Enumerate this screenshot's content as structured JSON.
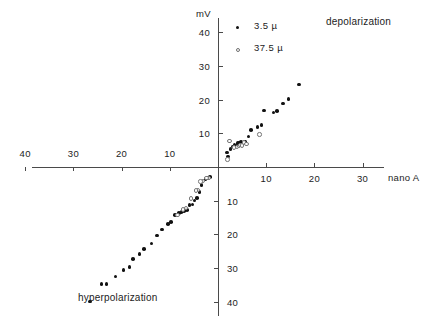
{
  "figure": {
    "width": 425,
    "height": 324,
    "background": "#ffffff",
    "axis_color": "#4a4a4a",
    "point_color": "#111111",
    "open_point_edge_color": "#777777"
  },
  "annotations": {
    "depolarization": "depolarization",
    "hyperpolarization": "hyperpolarization"
  },
  "legend": {
    "position": "top-center",
    "entries": [
      {
        "label": "3.5 µ",
        "marker": "filled-circle",
        "series": "3.5 µ"
      },
      {
        "label": "37.5 µ",
        "marker": "open-circle",
        "series": "37.5 µ"
      }
    ]
  },
  "axis_titles": {
    "y": "mV",
    "x": "nano A"
  },
  "chart_data": {
    "type": "scatter",
    "title": "",
    "subtitle": "",
    "xlabel": "nano A",
    "ylabel": "mV",
    "grid": false,
    "legend_position": "top-center",
    "quadrant_labels": {
      "upper_right": "depolarization",
      "lower_left": "hyperpolarization"
    },
    "axis_style": "four-quadrant cross through origin, magnitudes only (no minus signs)",
    "xlim": [
      -40,
      34
    ],
    "ylim": [
      -46,
      44
    ],
    "xticks_left_arm": [
      40,
      30,
      20,
      10
    ],
    "xticks_right_arm": [
      10,
      20,
      30
    ],
    "yticks_upper_arm": [
      10,
      20,
      30,
      40
    ],
    "yticks_lower_arm": [
      10,
      20,
      30,
      40
    ],
    "xtick_labels_left": [
      "40",
      "30",
      "20",
      "10"
    ],
    "xtick_labels_right": [
      "10",
      "20",
      "30"
    ],
    "ytick_labels_upper": [
      "10",
      "20",
      "30",
      "40"
    ],
    "ytick_labels_lower": [
      "10",
      "20",
      "30",
      "40"
    ],
    "series": [
      {
        "name": "3.5 µ",
        "marker": "filled-circle",
        "points": [
          [
            1.9,
            4.3
          ],
          [
            2.1,
            3.1
          ],
          [
            2.6,
            5.4
          ],
          [
            3.0,
            6.1
          ],
          [
            3.4,
            6.5
          ],
          [
            3.8,
            6.4
          ],
          [
            4.2,
            7.2
          ],
          [
            4.5,
            7.3
          ],
          [
            4.8,
            7.4
          ],
          [
            5.1,
            7.0
          ],
          [
            5.6,
            7.6
          ],
          [
            6.3,
            9.1
          ],
          [
            6.9,
            11.0
          ],
          [
            8.2,
            11.9
          ],
          [
            9.0,
            12.5
          ],
          [
            9.5,
            16.8
          ],
          [
            11.5,
            16.2
          ],
          [
            12.3,
            16.7
          ],
          [
            13.5,
            18.9
          ],
          [
            14.6,
            20.2
          ],
          [
            16.8,
            24.5
          ],
          [
            -1.6,
            -3.0
          ],
          [
            -2.1,
            -3.3
          ],
          [
            -2.6,
            -3.6
          ],
          [
            -3.4,
            -5.4
          ],
          [
            -3.8,
            -7.4
          ],
          [
            -4.4,
            -9.2
          ],
          [
            -4.9,
            -9.9
          ],
          [
            -5.3,
            -11.1
          ],
          [
            -5.9,
            -11.3
          ],
          [
            -6.4,
            -12.8
          ],
          [
            -7.0,
            -13.0
          ],
          [
            -7.6,
            -13.4
          ],
          [
            -8.1,
            -13.7
          ],
          [
            -8.9,
            -14.3
          ],
          [
            -9.8,
            -16.3
          ],
          [
            -10.4,
            -16.9
          ],
          [
            -11.6,
            -18.6
          ],
          [
            -12.6,
            -20.3
          ],
          [
            -13.8,
            -22.7
          ],
          [
            -15.3,
            -24.4
          ],
          [
            -16.3,
            -25.8
          ],
          [
            -17.6,
            -27.3
          ],
          [
            -18.4,
            -29.6
          ],
          [
            -19.6,
            -30.5
          ],
          [
            -21.3,
            -32.5
          ],
          [
            -23.1,
            -34.8
          ],
          [
            -24.2,
            -34.8
          ],
          [
            -26.6,
            -39.9
          ]
        ]
      },
      {
        "name": "37.5 µ",
        "marker": "open-circle",
        "points": [
          [
            2.0,
            2.2
          ],
          [
            2.4,
            7.8
          ],
          [
            3.3,
            5.8
          ],
          [
            3.9,
            5.9
          ],
          [
            4.3,
            6.2
          ],
          [
            4.7,
            6.6
          ],
          [
            5.0,
            6.4
          ],
          [
            5.4,
            7.3
          ],
          [
            5.9,
            6.9
          ],
          [
            8.6,
            9.7
          ],
          [
            -1.9,
            -3.2
          ],
          [
            -2.4,
            -3.3
          ],
          [
            -3.1,
            -4.1
          ],
          [
            -3.6,
            -4.3
          ],
          [
            -4.2,
            -6.9
          ],
          [
            -4.6,
            -7.0
          ],
          [
            -5.6,
            -9.3
          ],
          [
            -6.6,
            -12.1
          ],
          [
            -7.2,
            -12.6
          ],
          [
            -8.4,
            -14.2
          ]
        ]
      }
    ]
  }
}
